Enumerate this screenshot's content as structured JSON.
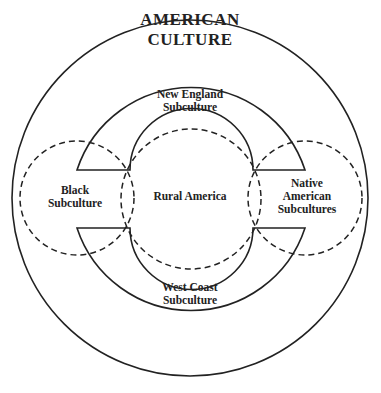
{
  "diagram": {
    "title_line1": "AMERICAN",
    "title_line2": "CULTURE",
    "regions": {
      "new_england": {
        "line1": "New England",
        "line2": "Subculture"
      },
      "west_coast": {
        "line1": "West Coast",
        "line2": "Subculture"
      },
      "rural": {
        "line1": "Rural America"
      },
      "black": {
        "line1": "Black",
        "line2": "Subculture"
      },
      "native": {
        "line1": "Native",
        "line2": "American",
        "line3": "Subcultures"
      }
    },
    "colors": {
      "stroke": "#222222",
      "background": "#ffffff"
    }
  }
}
